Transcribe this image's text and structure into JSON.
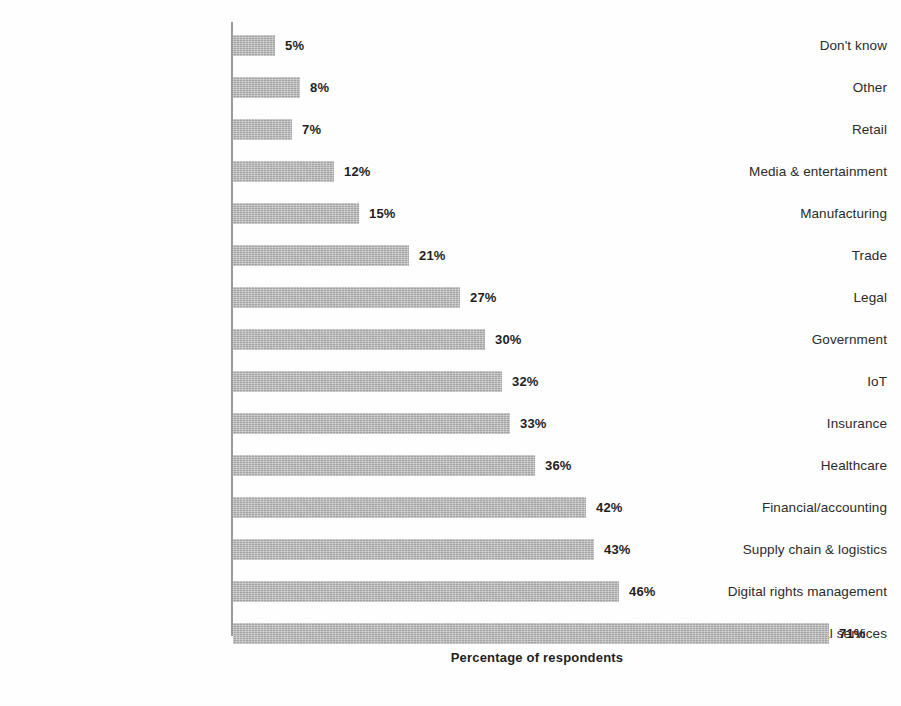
{
  "chart_data": {
    "type": "bar",
    "orientation": "horizontal",
    "title": "",
    "subtitle": "",
    "xlabel": "Percentage of respondents",
    "ylabel": "",
    "xlim": [
      0,
      75
    ],
    "grid": false,
    "legend": null,
    "value_suffix": "%",
    "categories": [
      "Don't know",
      "Other",
      "Retail",
      "Media & entertainment",
      "Manufacturing",
      "Trade",
      "Legal",
      "Government",
      "IoT",
      "Insurance",
      "Healthcare",
      "Financial/accounting",
      "Supply chain & logistics",
      "Digital rights management",
      "Banking & financial services"
    ],
    "values": [
      5,
      8,
      7,
      12,
      15,
      21,
      27,
      30,
      32,
      33,
      36,
      42,
      43,
      46,
      71
    ],
    "value_labels": [
      "5%",
      "8%",
      "7%",
      "12%",
      "15%",
      "21%",
      "27%",
      "30%",
      "32%",
      "33%",
      "36%",
      "42%",
      "43%",
      "46%",
      "71%"
    ],
    "colors": {
      "bar": "#b4b4b4",
      "axis": "#9a9a9a",
      "label_text": "#2b2b2b",
      "value_text": "#1f1f1f",
      "background": "#fefefe"
    }
  }
}
